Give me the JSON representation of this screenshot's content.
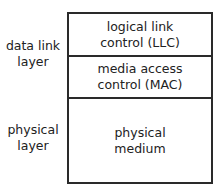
{
  "diagram": {
    "type": "layer-stack",
    "colors": {
      "border": "#2a2a2a",
      "text": "#222222",
      "background": "#ffffff"
    },
    "side_labels": [
      {
        "line1": "data link",
        "line2": "layer"
      },
      {
        "line1": "physical",
        "line2": "layer"
      }
    ],
    "cells": [
      {
        "line1": "logical link",
        "line2": "control (LLC)"
      },
      {
        "line1": "media access",
        "line2": "control (MAC)"
      },
      {
        "line1": "physical",
        "line2": "medium"
      }
    ]
  }
}
